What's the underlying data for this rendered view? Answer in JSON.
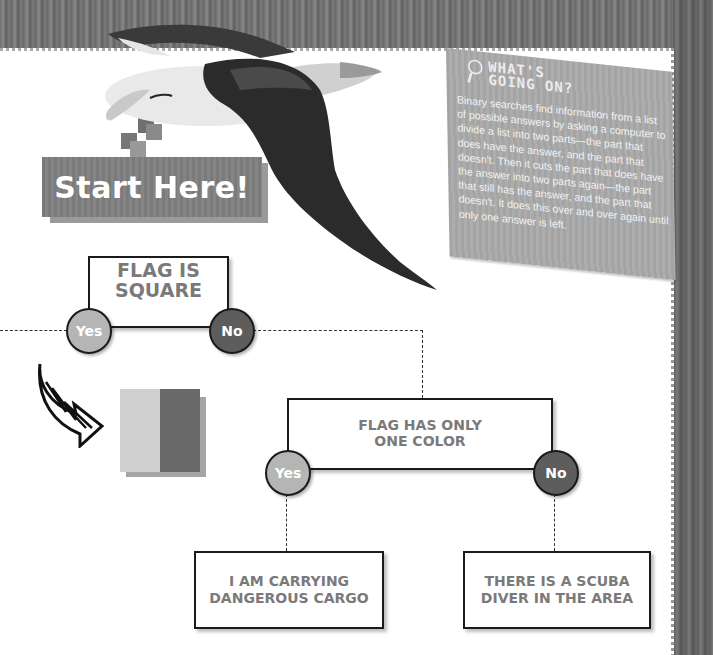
{
  "banner": {
    "label": "Start Here!"
  },
  "info_card": {
    "icon": "magnifier-icon",
    "title_line1": "WHAT'S",
    "title_line2": "GOING ON?",
    "body": "Binary searches find information from a list of possible answers by asking a computer to divide a list into two parts—the part that does have the answer, and the part that doesn't. Then it cuts the part that does have the answer into two parts again—the part that still has the answer, and the part that doesn't. It does this over and over again until only one answer is left."
  },
  "flowchart": {
    "q1": {
      "line1": "FLAG IS",
      "line2": "SQUARE",
      "yes": "Yes",
      "no": "No"
    },
    "q2": {
      "line1": "FLAG HAS ONLY",
      "line2": "ONE COLOR",
      "yes": "Yes",
      "no": "No"
    },
    "a1": {
      "line1": "I AM CARRYING",
      "line2": "DANGEROUS CARGO"
    },
    "a2": {
      "line1": "THERE IS A SCUBA",
      "line2": "DIVER IN THE AREA"
    }
  },
  "flag_example": {
    "left_color": "#cfcfcf",
    "right_color": "#6a6a6a"
  },
  "colors": {
    "yes_node": "#b5b5b5",
    "no_node": "#5d5d5d",
    "box_text": "#7a7a7a",
    "banner": "#7f7f7f",
    "card": "#a8a8a8"
  }
}
